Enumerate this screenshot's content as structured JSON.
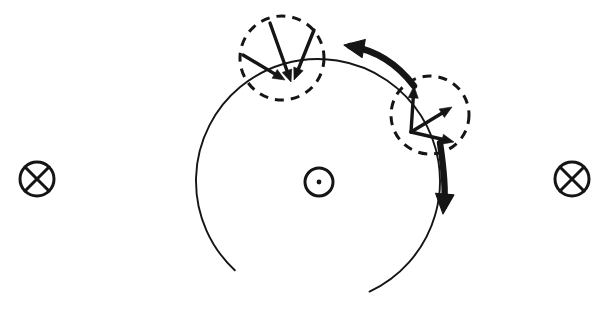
{
  "figure": {
    "background_color": "#ffffff",
    "ink_color": "#151515",
    "width": 609,
    "height": 321
  },
  "orbit": {
    "label": "orbit-circle",
    "center_x": 318,
    "center_y": 181,
    "radius": 122,
    "stroke_width": 1.9,
    "arc_start_deg": 133,
    "arc_sweep_deg": 292
  },
  "field_symbols": [
    {
      "name": "field-into-page-left",
      "glyph": "circle-cross",
      "meaning": "field into page",
      "center_x": 37,
      "center_y": 179,
      "radius": 17
    },
    {
      "name": "field-out-of-page-center",
      "glyph": "circle-dot",
      "meaning": "field out of page",
      "center_x": 319,
      "center_y": 182,
      "radius": 14,
      "dot_radius": 2.4
    },
    {
      "name": "field-into-page-right",
      "glyph": "circle-cross",
      "meaning": "field into page",
      "center_x": 572,
      "center_y": 179,
      "radius": 17
    }
  ],
  "dashed_circles": [
    {
      "name": "dashed-circle-upper-left",
      "center_x": 282,
      "center_y": 58,
      "radius": 42,
      "dash_pattern": "9 7",
      "stroke_width": 3.0
    },
    {
      "name": "dashed-circle-right",
      "center_x": 430,
      "center_y": 115,
      "radius": 39,
      "dash_pattern": "9 7",
      "stroke_width": 3.0
    }
  ],
  "vector_groups": [
    {
      "name": "vector-group-upper-left",
      "origin_x": 288,
      "origin_y": 80,
      "description": "three converging arrows pointing down and down-right",
      "vectors": [
        {
          "name": "vector-upper-left-a",
          "label": "down-right arrow from upper-left",
          "x1": 243,
          "y1": 55,
          "x2": 285,
          "y2": 80,
          "head_size": 12
        },
        {
          "name": "vector-upper-left-b",
          "label": "downward arrow from top",
          "x1": 270,
          "y1": 23,
          "x2": 291,
          "y2": 82,
          "head_size": 12
        },
        {
          "name": "vector-upper-left-c",
          "label": "down-left arrow from upper-right",
          "x1": 314,
          "y1": 30,
          "x2": 294,
          "y2": 80,
          "head_size": 12
        }
      ]
    },
    {
      "name": "vector-group-right",
      "origin_x": 411,
      "origin_y": 132,
      "description": "three diverging arrows pointing up, up-right and right",
      "vectors": [
        {
          "name": "vector-right-a",
          "label": "upward arrow",
          "x1": 411,
          "y1": 132,
          "x2": 414,
          "y2": 86,
          "head_size": 12
        },
        {
          "name": "vector-right-b",
          "label": "up-right diagonal arrow",
          "x1": 411,
          "y1": 132,
          "x2": 452,
          "y2": 107,
          "head_size": 12
        },
        {
          "name": "vector-right-c",
          "label": "right-down arrow",
          "x1": 411,
          "y1": 132,
          "x2": 454,
          "y2": 142,
          "head_size": 12
        }
      ]
    }
  ],
  "thick_arrows": [
    {
      "name": "thick-arrow-leftward",
      "label": "curved arrow from right circle to upper-left circle",
      "path": "M 414 86 C 396 62 374 50 350 46",
      "head_x": 344,
      "head_y": 45,
      "head_angle_deg": 190,
      "head_size": 20,
      "stroke_width": 6.4
    },
    {
      "name": "thick-arrow-downward",
      "label": "downward arrow leaving right circle",
      "path": "M 440 143 C 444 170 446 190 444 206",
      "head_x": 443,
      "head_y": 214,
      "head_angle_deg": 95,
      "head_size": 20,
      "stroke_width": 6.4
    }
  ]
}
